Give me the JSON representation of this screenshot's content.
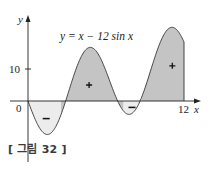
{
  "chart_data": {
    "type": "area",
    "title": "y = x − 12 sin x",
    "function": "x - 12*sin(x)",
    "xlabel": "x",
    "ylabel": "y",
    "x_range": [
      0,
      12
    ],
    "xlim": [
      -2.1,
      13.5
    ],
    "ylim": [
      -14,
      26
    ],
    "x_ticks": [
      {
        "value": 0,
        "label": "0"
      },
      {
        "value": 12,
        "label": "12"
      }
    ],
    "y_ticks": [
      {
        "value": 10,
        "label": "10"
      }
    ],
    "grid": false,
    "regions": [
      {
        "x_from": 0,
        "x_to": 2.54,
        "sign": "-",
        "label": "−",
        "fill": "#ececec"
      },
      {
        "x_from": 2.54,
        "x_to": 7.35,
        "sign": "+",
        "label": "+",
        "fill": "#c4c4c4"
      },
      {
        "x_from": 7.35,
        "x_to": 8.75,
        "sign": "-",
        "label": "−",
        "fill": "#ececec"
      },
      {
        "x_from": 8.75,
        "x_to": 12,
        "sign": "+",
        "label": "+",
        "fill": "#c4c4c4"
      }
    ],
    "region_label_positions": [
      {
        "x": 1.4,
        "y": -5.5
      },
      {
        "x": 4.7,
        "y": 5
      },
      {
        "x": 8.0,
        "y": -2
      },
      {
        "x": 11.1,
        "y": 11
      }
    ]
  },
  "labels": {
    "equation": "y = x − 12 sin x",
    "x_axis": "x",
    "y_axis": "y",
    "tick_10": "10",
    "tick_0": "0",
    "tick_12": "12"
  },
  "caption": "[ 그림 32 ]",
  "colors": {
    "positive_fill": "#c4c4c4",
    "negative_fill": "#ececec",
    "curve": "#333333",
    "axis": "#222222"
  }
}
